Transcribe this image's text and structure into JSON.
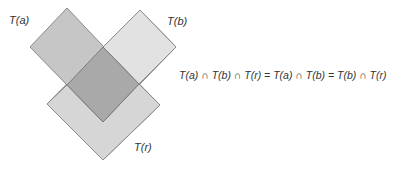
{
  "labels": {
    "ta": "T(a)",
    "tb": "T(b)",
    "tr": "T(r)"
  },
  "formula": "T(a) ∩ T(b) ∩ T(r) = T(a) ∩ T(b) = T(b) ∩ T(r)",
  "colors": {
    "ta_fill": "#c6c6c6",
    "tb_fill": "#e2e2e2",
    "tr_fill": "#d6d6d6",
    "overlap_fill": "#a9a9a9",
    "stroke": "#8a8a8a"
  }
}
